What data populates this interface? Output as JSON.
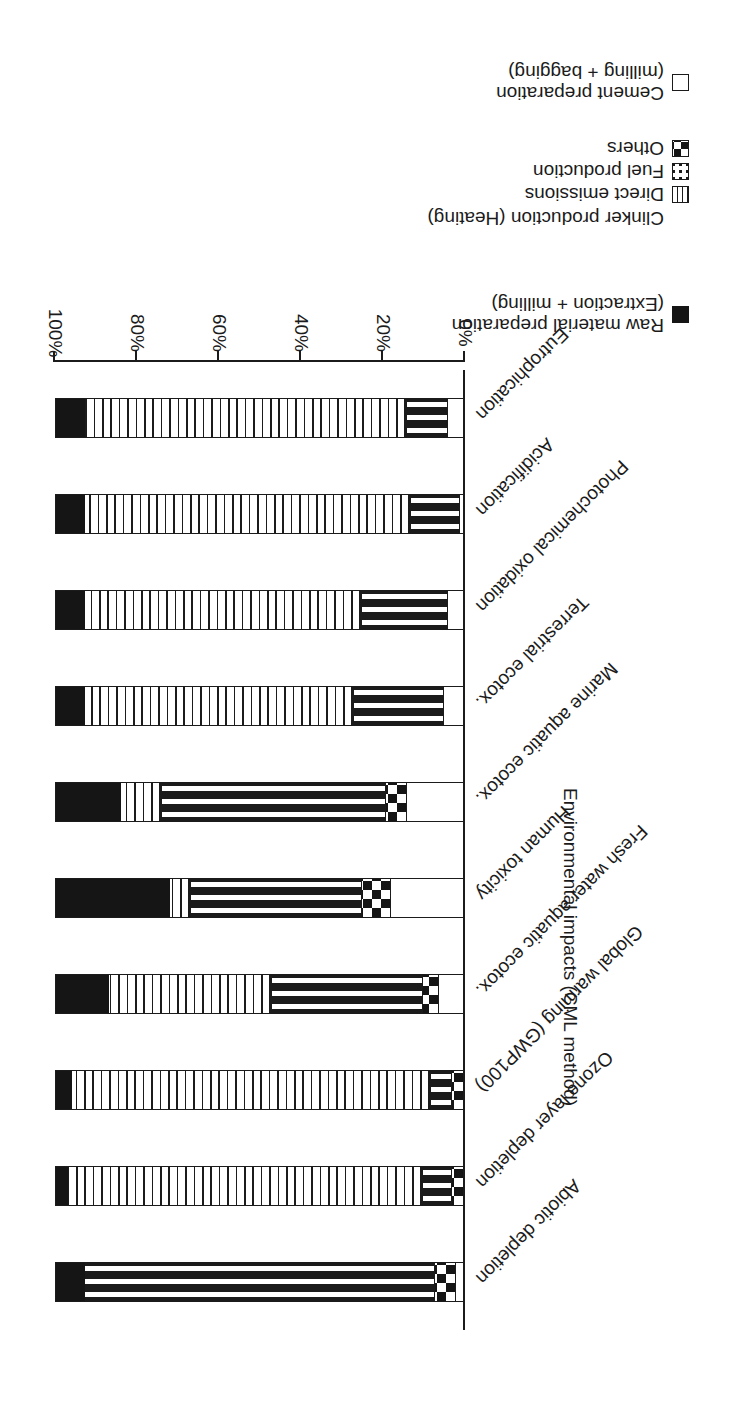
{
  "chart_data": {
    "type": "bar",
    "subtype": "stacked-horizontal-100-percent",
    "title": "",
    "xlabel": "",
    "ylabel": "Environmental impacts (CML method)",
    "ylim": [
      0,
      100
    ],
    "ytick_labels": [
      "0%",
      "20%",
      "40%",
      "60%",
      "80%",
      "100%"
    ],
    "ytick_values": [
      0,
      20,
      40,
      60,
      80,
      100
    ],
    "grid": false,
    "legend_position": "top-right",
    "categories": [
      "Abiotic depletion",
      "Ozone layer depletion",
      "Global warming (GWP100)",
      "Fresh water aquatic ecotox.",
      "Human toxicity",
      "Marine aquatic ecotox.",
      "Terrestrial ecotox.",
      "Photochemical oxidation",
      "Acidification",
      "Eutrophication"
    ],
    "series": [
      {
        "name": "Raw material preparation (Extraction + milling)",
        "key": "raw",
        "pattern": "solid-black",
        "color": "#151515",
        "values": [
          7,
          3,
          4,
          13,
          28,
          16,
          7,
          7,
          7,
          7
        ]
      },
      {
        "name": "Direct emissions",
        "key": "direct",
        "pattern": "vertical-lines",
        "color": "#ffffff",
        "values": [
          0,
          87,
          88,
          40,
          5,
          10,
          66,
          68,
          80,
          79
        ]
      },
      {
        "name": "Fuel production",
        "key": "fuel",
        "pattern": "dotted",
        "color": "#ffffff",
        "values": [
          86,
          7,
          5,
          37,
          42,
          55,
          22,
          21,
          12,
          10
        ]
      },
      {
        "name": "Others",
        "key": "others",
        "pattern": "checkerboard",
        "color": "#ffffff",
        "values": [
          5,
          3,
          3,
          4,
          7,
          5,
          0,
          0,
          0,
          0
        ]
      },
      {
        "name": "Cement preparation (milling + bagging)",
        "key": "cement",
        "pattern": "solid-white",
        "color": "#ffffff",
        "values": [
          2,
          0,
          0,
          6,
          18,
          14,
          5,
          4,
          1,
          4
        ]
      }
    ]
  },
  "axis": {
    "y_title": "Environmental impacts (CML method)",
    "ticks": [
      "0%",
      "20%",
      "40%",
      "60%",
      "80%",
      "100%"
    ]
  },
  "legend": {
    "groups": [
      {
        "heading_line1": "Raw material preparation",
        "heading_line2": "(Extraction + milling)",
        "heading": "Raw material preparation (Extraction + milling)",
        "key_pattern": "solid-black",
        "items": []
      },
      {
        "heading_line1": "Clinker production (Heating)",
        "heading_line2": "",
        "heading": "Clinker production (Heating)",
        "key_pattern": "none",
        "items": [
          {
            "label": "Direct emissions",
            "key_pattern": "vertical-lines"
          },
          {
            "label": "Fuel production",
            "key_pattern": "dotted"
          },
          {
            "label": "Others",
            "key_pattern": "checkerboard"
          }
        ]
      },
      {
        "heading_line1": "Cement preparation",
        "heading_line2": "(milling + bagging)",
        "heading": "Cement preparation (milling + bagging)",
        "key_pattern": "solid-white",
        "items": []
      }
    ]
  },
  "colors": {
    "ink": "#1b1b1b",
    "black_fill": "#151515",
    "white_fill": "#ffffff",
    "background": "#ffffff"
  }
}
